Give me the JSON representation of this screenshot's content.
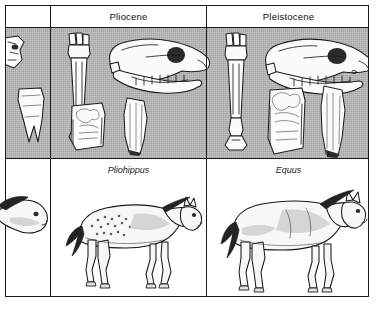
{
  "figure": {
    "epochs": [
      {
        "key": "partial",
        "label": ""
      },
      {
        "key": "pliocene",
        "label": "Pliocene"
      },
      {
        "key": "pleistocene",
        "label": "Pleistocene"
      }
    ],
    "genus_labels": [
      {
        "key": "partial",
        "label": ""
      },
      {
        "key": "pliohippus",
        "label": "Pliohippus"
      },
      {
        "key": "equus",
        "label": "Equus"
      }
    ],
    "specimens": {
      "partial": {
        "items": [
          "partial-limb-bone",
          "molar-tooth",
          "horse-head"
        ]
      },
      "pliocene": {
        "items": [
          "metacarpal-bone",
          "skull",
          "molar-occlusal",
          "molar-lateral",
          "horse-figure"
        ]
      },
      "pleistocene": {
        "items": [
          "metacarpal-bone",
          "skull",
          "molar-occlusal",
          "molar-lateral",
          "horse-figure"
        ]
      }
    },
    "colors": {
      "fossil_band": "#b4b4b4",
      "border": "#1a1a1a",
      "bone": "#fbfbfb",
      "page": "#ffffff"
    }
  }
}
